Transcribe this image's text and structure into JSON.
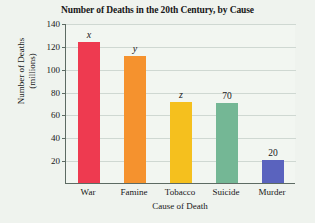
{
  "chart_data": {
    "type": "bar",
    "title": "Number of Deaths in the 20th Century, by Cause",
    "xlabel": "Cause of Death",
    "ylabel": "Number of Deaths (millions)",
    "ylabel_line1": "Number of Deaths",
    "ylabel_line2": "(millions)",
    "categories": [
      "War",
      "Famine",
      "Tobacco",
      "Suicide",
      "Murder"
    ],
    "values": [
      123,
      111,
      71,
      70,
      20
    ],
    "data_labels": [
      "x",
      "y",
      "z",
      "70",
      "20"
    ],
    "label_styles": [
      "italic",
      "italic",
      "italic",
      "normal",
      "normal"
    ],
    "colors": [
      "#ee3a50",
      "#f5922e",
      "#f5c01e",
      "#74b795",
      "#5a63be"
    ],
    "ylim": [
      0,
      140
    ],
    "yticks": [
      20,
      40,
      60,
      80,
      100,
      120,
      140
    ],
    "ytick_labels": [
      "20",
      "40",
      "60",
      "80",
      "100",
      "120",
      "140"
    ],
    "grid": true,
    "legend": "none",
    "plot_background": "#f2f6f1",
    "page_background": "#eff3ee",
    "axis_color": "#5d6b63",
    "gridline_color": "#cfd8d2"
  }
}
